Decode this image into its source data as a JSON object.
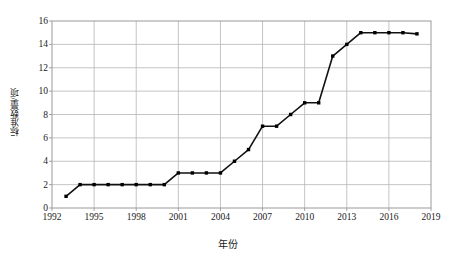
{
  "chart_data": {
    "type": "line",
    "title": "",
    "xlabel": "年份",
    "ylabel": "标准数量/项",
    "xlim": [
      1992,
      2019
    ],
    "ylim": [
      0,
      16
    ],
    "xticks": [
      1992,
      1995,
      1998,
      2001,
      2004,
      2007,
      2010,
      2013,
      2016,
      2019
    ],
    "yticks": [
      0,
      2,
      4,
      6,
      8,
      10,
      12,
      14,
      16
    ],
    "grid": true,
    "legend": "none",
    "series": [
      {
        "name": "标准数量",
        "marker": "square",
        "color": "#000000",
        "x": [
          1993,
          1994,
          1995,
          1996,
          1997,
          1998,
          1999,
          2000,
          2001,
          2002,
          2003,
          2004,
          2005,
          2006,
          2007,
          2008,
          2009,
          2010,
          2011,
          2012,
          2013,
          2014,
          2015,
          2016,
          2017,
          2018
        ],
        "values": [
          1,
          2,
          2,
          2,
          2,
          2,
          2,
          2,
          3,
          3,
          3,
          3,
          4,
          5,
          7,
          7,
          8,
          9,
          9,
          13,
          14,
          15,
          15,
          15,
          15,
          14.9
        ]
      }
    ],
    "points": [
      {
        "year": 1993,
        "value": 1
      },
      {
        "year": 1994,
        "value": 2
      },
      {
        "year": 1995,
        "value": 2
      },
      {
        "year": 1996,
        "value": 2
      },
      {
        "year": 1997,
        "value": 2
      },
      {
        "year": 1998,
        "value": 2
      },
      {
        "year": 1999,
        "value": 2
      },
      {
        "year": 2000,
        "value": 2
      },
      {
        "year": 2001,
        "value": 3
      },
      {
        "year": 2002,
        "value": 3
      },
      {
        "year": 2003,
        "value": 3
      },
      {
        "year": 2004,
        "value": 3
      },
      {
        "year": 2005,
        "value": 4
      },
      {
        "year": 2006,
        "value": 5
      },
      {
        "year": 2007,
        "value": 7
      },
      {
        "year": 2008,
        "value": 7
      },
      {
        "year": 2009,
        "value": 8
      },
      {
        "year": 2010,
        "value": 9
      },
      {
        "year": 2011,
        "value": 9
      },
      {
        "year": 2012,
        "value": 13
      },
      {
        "year": 2013,
        "value": 14
      },
      {
        "year": 2014,
        "value": 15
      },
      {
        "year": 2015,
        "value": 15
      },
      {
        "year": 2016,
        "value": 15
      },
      {
        "year": 2017,
        "value": 15
      },
      {
        "year": 2018,
        "value": 14.9
      }
    ]
  },
  "style": {
    "line_color": "#111111",
    "marker_color": "#000000",
    "grid_color": "#b5b5b5",
    "frame_color": "#9a9a9a",
    "background": "#ffffff",
    "text_color": "#1a1a1a"
  },
  "plot_geometry": {
    "left": 52,
    "right": 431,
    "top": 21,
    "bottom": 208
  }
}
